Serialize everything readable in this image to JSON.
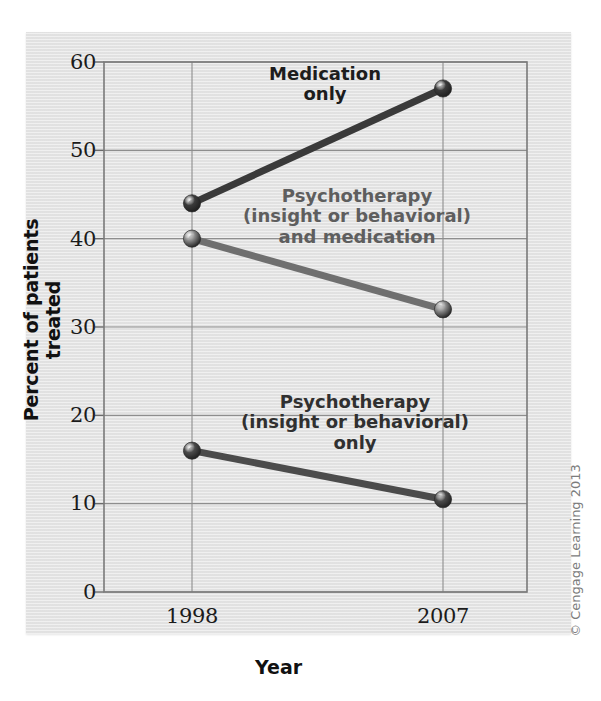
{
  "figure": {
    "copyright": "© Cengage Learning 2013",
    "panel_color": "#e4e4e4",
    "page_color": "#ffffff"
  },
  "chart_data": {
    "type": "line",
    "title": "",
    "xlabel": "Year",
    "ylabel": "Percent of patients treated",
    "categories": [
      "1998",
      "2007"
    ],
    "x": [
      1998,
      2007
    ],
    "xtick_labels": [
      "1998",
      "2007"
    ],
    "ytick_labels": [
      "0",
      "10",
      "20",
      "30",
      "40",
      "50",
      "60"
    ],
    "yticks": [
      0,
      10,
      20,
      30,
      40,
      50,
      60
    ],
    "ylim": [
      0,
      60
    ],
    "grid": true,
    "grid_axis": "both",
    "legend": "inline-labels",
    "marker": "circle",
    "series": [
      {
        "name": "Medication only",
        "label_text": "Medication\nonly",
        "values": [
          44,
          57
        ],
        "color": "#3a3a3a",
        "marker_color": "#3b3b3b"
      },
      {
        "name": "Psychotherapy (insight or behavioral) and medication",
        "label_text": "Psychotherapy\n(insight or behavioral)\nand medication",
        "values": [
          40,
          32
        ],
        "color": "#6f6f6f",
        "marker_color": "#8a8a8a"
      },
      {
        "name": "Psychotherapy (insight or behavioral) only",
        "label_text": "Psychotherapy\n(insight or behavioral)\nonly",
        "values": [
          16,
          10.5
        ],
        "color": "#4b4b4b",
        "marker_color": "#4b4b4b"
      }
    ]
  },
  "axes": {
    "y_ticks": [
      {
        "value": 60,
        "label": "60"
      },
      {
        "value": 50,
        "label": "50"
      },
      {
        "value": 40,
        "label": "40"
      },
      {
        "value": 30,
        "label": "30"
      },
      {
        "value": 20,
        "label": "20"
      },
      {
        "value": 10,
        "label": "10"
      },
      {
        "value": 0,
        "label": "0"
      }
    ],
    "x_ticks": [
      {
        "value": 1998,
        "label": "1998"
      },
      {
        "value": 2007,
        "label": "2007"
      }
    ],
    "y_title": "Percent of patients treated",
    "x_title": "Year"
  }
}
